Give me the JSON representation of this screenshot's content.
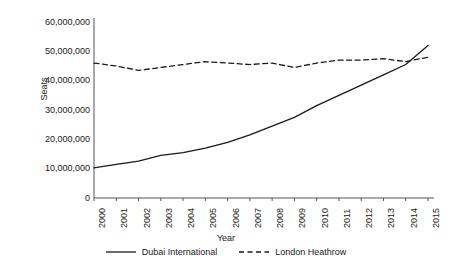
{
  "chart_data": {
    "type": "line",
    "title": "",
    "subtitle": "",
    "xlabel": "Year",
    "ylabel": "Seats",
    "categories": [
      "2000",
      "2001",
      "2002",
      "2003",
      "2004",
      "2005",
      "2006",
      "2007",
      "2008",
      "2009",
      "2010",
      "2011",
      "2012",
      "2013",
      "2014",
      "2015"
    ],
    "x": [
      2000,
      2001,
      2002,
      2003,
      2004,
      2005,
      2006,
      2007,
      2008,
      2009,
      2010,
      2011,
      2012,
      2013,
      2014,
      2015
    ],
    "xlim": [
      2000,
      2015
    ],
    "ylim": [
      0,
      60000000
    ],
    "ytick_labels": [
      "0",
      "10,000,000",
      "20,000,000",
      "30,000,000",
      "40,000,000",
      "50,000,000",
      "60,000,000"
    ],
    "ytick_values": [
      0,
      10000000,
      20000000,
      30000000,
      40000000,
      50000000,
      60000000
    ],
    "grid": false,
    "legend_position": "bottom",
    "series": [
      {
        "name": "Dubai International",
        "style": "solid",
        "color": "#1a1a1a",
        "values": [
          10300000,
          11500000,
          12600000,
          14500000,
          15500000,
          17000000,
          19000000,
          21500000,
          24500000,
          27500000,
          31500000,
          35000000,
          38500000,
          42000000,
          45500000,
          52000000
        ]
      },
      {
        "name": "London Heathrow",
        "style": "dashed",
        "color": "#1a1a1a",
        "values": [
          46000000,
          45000000,
          43500000,
          44500000,
          45500000,
          46500000,
          46000000,
          45500000,
          46000000,
          44500000,
          46000000,
          47000000,
          47000000,
          47500000,
          46500000,
          48000000
        ]
      }
    ]
  },
  "axes": {
    "y_title": "Seats",
    "x_title": "Year"
  },
  "legend": {
    "items": [
      {
        "label": "Dubai International",
        "style": "solid"
      },
      {
        "label": "London Heathrow",
        "style": "dashed"
      }
    ]
  },
  "colors": {
    "ink": "#1a1a1a",
    "background": "#ffffff",
    "axis": "#555555"
  }
}
